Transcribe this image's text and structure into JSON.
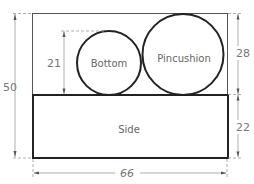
{
  "diagram": {
    "type": "cutting-layout",
    "pieces": [
      {
        "name": "Bottom",
        "shape": "circle"
      },
      {
        "name": "Pincushion",
        "shape": "circle"
      },
      {
        "name": "Side",
        "shape": "rectangle"
      }
    ],
    "labels": {
      "bottom": "Bottom",
      "pincushion": "Pincushion",
      "side": "Side"
    },
    "dimensions": {
      "total_height": "50",
      "bottom_diameter": "21",
      "pincushion_height": "28",
      "side_height": "22",
      "total_width": "66"
    },
    "colors": {
      "outline": "#222222",
      "dimension_line": "#999999",
      "text": "#666666"
    }
  }
}
